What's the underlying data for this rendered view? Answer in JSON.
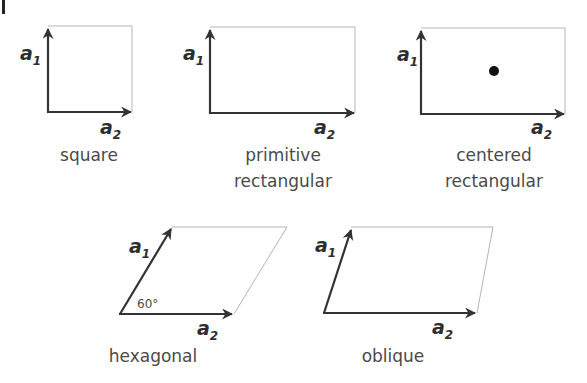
{
  "figure": {
    "panel_mark": "I",
    "vector_a1": "a",
    "vector_a1_sub": "1",
    "vector_a2": "a",
    "vector_a2_sub": "2",
    "lattices": [
      {
        "id": "square",
        "name_lines": [
          "square"
        ],
        "has_center_point": false
      },
      {
        "id": "primitive-rectangular",
        "name_lines": [
          "primitive",
          "rectangular"
        ],
        "has_center_point": false
      },
      {
        "id": "centered-rectangular",
        "name_lines": [
          "centered",
          "rectangular"
        ],
        "has_center_point": true
      },
      {
        "id": "hexagonal",
        "name_lines": [
          "hexagonal"
        ],
        "angle_label": "60°",
        "has_center_point": false
      },
      {
        "id": "oblique",
        "name_lines": [
          "oblique"
        ],
        "has_center_point": false
      }
    ]
  },
  "colors": {
    "vector": "#333333",
    "cell_edge": "#b5b5b5",
    "text": "#4a4a4a",
    "center_point": "#111111"
  }
}
